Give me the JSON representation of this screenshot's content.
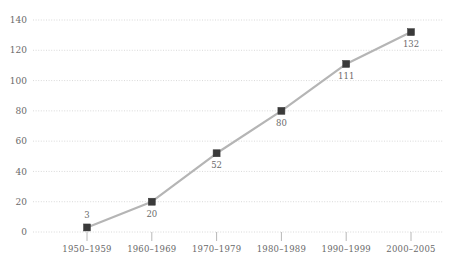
{
  "chart_data": {
    "type": "line",
    "title": "",
    "subtitle": "",
    "xlabel": "",
    "ylabel": "",
    "categories": [
      "1950–1959",
      "1960–1969",
      "1970–1979",
      "1980–1989",
      "1990–1999",
      "2000–2005"
    ],
    "values": [
      3,
      20,
      52,
      80,
      111,
      132
    ],
    "point_labels": [
      "3",
      "20",
      "52",
      "80",
      "111",
      "132"
    ],
    "point_label_positions": [
      "above",
      "below",
      "below",
      "below",
      "below",
      "below"
    ],
    "ylim": [
      0,
      140
    ],
    "yticks": [
      0,
      20,
      40,
      60,
      80,
      100,
      120,
      140
    ],
    "ytick_labels": [
      "0",
      "20",
      "40",
      "60",
      "80",
      "100",
      "120",
      "140"
    ],
    "grid": true,
    "grid_style": "dotted-horizontal",
    "legend": false,
    "legend_position": "none",
    "marker": "square",
    "colors": {
      "line": "#b5b5b5",
      "marker": "#3a3a3a",
      "grid": "#cfcfcf",
      "text": "#6a6a6a",
      "background": "#ffffff",
      "tick": "#b8b8b8"
    }
  }
}
